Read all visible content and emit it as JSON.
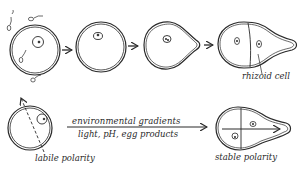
{
  "figure": {
    "top_row": {
      "stages": [
        {
          "id": "fertilization",
          "description": "egg with sperm around it"
        },
        {
          "id": "zygote",
          "description": "spherical zygote"
        },
        {
          "id": "bulging",
          "description": "zygote bulging on one side"
        },
        {
          "id": "two-cell",
          "description": "first division forming rhizoid cell"
        }
      ],
      "rhizoid_label": "rhizoid cell"
    },
    "bottom_row": {
      "left_label": "labile polarity",
      "right_label": "stable polarity",
      "arrow_label_top": "environmental gradients",
      "arrow_label_bottom": "light, pH, egg products"
    },
    "colors": {
      "ink": "#2a2a2a",
      "background": "#ffffff"
    }
  }
}
